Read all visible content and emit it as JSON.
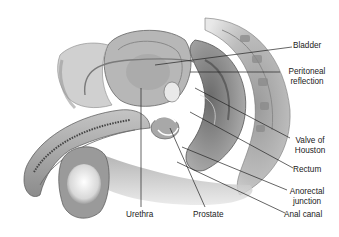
{
  "figure": {
    "labels": {
      "bladder": "Bladder",
      "peritoneal_reflection_1": "Peritoneal",
      "peritoneal_reflection_2": "reflection",
      "valve_of_houston_1": "Valve of",
      "valve_of_houston_2": "Houston",
      "rectum": "Rectum",
      "anorectal_junction_1": "Anorectal",
      "anorectal_junction_2": "junction",
      "anal_canal": "Anal canal",
      "urethra": "Urethra",
      "prostate": "Prostate"
    }
  }
}
